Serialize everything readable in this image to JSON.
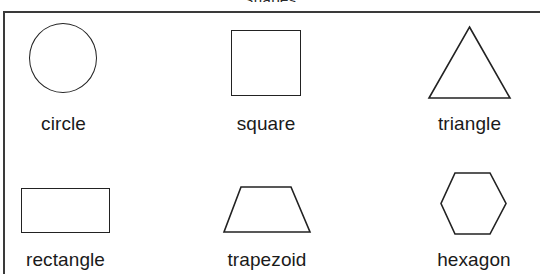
{
  "sheet": {
    "title": "Shapes",
    "frame_color": "#3a3a3a",
    "shape_stroke_color": "#222222",
    "label_color": "#1a1a1a",
    "background": "#ffffff"
  },
  "shapes": [
    {
      "id": "circle",
      "label": "circle",
      "icon": "circle-outline-icon"
    },
    {
      "id": "square",
      "label": "square",
      "icon": "square-outline-icon"
    },
    {
      "id": "triangle",
      "label": "triangle",
      "icon": "triangle-outline-icon"
    },
    {
      "id": "rectangle",
      "label": "rectangle",
      "icon": "rectangle-outline-icon"
    },
    {
      "id": "trapezoid",
      "label": "trapezoid",
      "icon": "trapezoid-outline-icon"
    },
    {
      "id": "hexagon",
      "label": "hexagon",
      "icon": "hexagon-outline-icon"
    }
  ],
  "geometry": {
    "triangle_points": "40,71 0,71 20,0",
    "trapezoid_points": "17,0 67,0 86,45 0,45",
    "hexagon_points": "14,0 49,0 65,31 49,61 14,61 0,31"
  }
}
